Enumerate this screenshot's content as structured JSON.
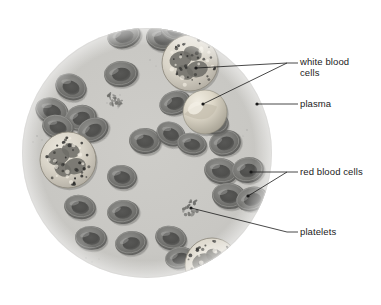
{
  "figure": {
    "type": "biological-diagram",
    "background_color": "#ffffff",
    "field_color": "#c9c8c4",
    "field_edge_color": "#b4b3af"
  },
  "microscope_field": {
    "name": "circular-field-of-view",
    "center_x": 147,
    "center_y": 153,
    "radius": 125
  },
  "labels": [
    {
      "id": "white-blood-cells",
      "text_line_1": "white blood",
      "text_line_2": "cells",
      "text_x": 300,
      "text_y": 57,
      "dash_x1": 287,
      "dash_y1": 63,
      "dash_x2": 298,
      "dash_y2": 63,
      "leaders": [
        {
          "x1": 287,
          "y1": 63,
          "x2": 196,
          "y2": 68
        },
        {
          "x1": 287,
          "y1": 63,
          "x2": 203,
          "y2": 104
        }
      ],
      "dots": [
        {
          "x": 196,
          "y": 68
        },
        {
          "x": 203,
          "y": 104
        }
      ]
    },
    {
      "id": "plasma",
      "text_line_1": "plasma",
      "text_line_2": "",
      "text_x": 300,
      "text_y": 99,
      "dash_x1": 287,
      "dash_y1": 104,
      "dash_x2": 298,
      "dash_y2": 104,
      "leaders": [
        {
          "x1": 287,
          "y1": 104,
          "x2": 257,
          "y2": 104
        }
      ],
      "dots": [
        {
          "x": 257,
          "y": 104
        }
      ]
    },
    {
      "id": "red-blood-cells",
      "text_line_1": "red blood cells",
      "text_line_2": "",
      "text_x": 300,
      "text_y": 167,
      "dash_x1": 287,
      "dash_y1": 172,
      "dash_x2": 298,
      "dash_y2": 172,
      "leaders": [
        {
          "x1": 287,
          "y1": 172,
          "x2": 251,
          "y2": 172
        },
        {
          "x1": 287,
          "y1": 172,
          "x2": 248,
          "y2": 196
        }
      ],
      "dots": [
        {
          "x": 251,
          "y": 172
        },
        {
          "x": 248,
          "y": 196
        }
      ]
    },
    {
      "id": "platelets",
      "text_line_1": "platelets",
      "text_line_2": "",
      "text_x": 300,
      "text_y": 227,
      "dash_x1": 287,
      "dash_y1": 232,
      "dash_x2": 298,
      "dash_y2": 232,
      "leaders": [
        {
          "x1": 287,
          "y1": 232,
          "x2": 191,
          "y2": 208
        }
      ],
      "dots": [
        {
          "x": 191,
          "y": 208
        }
      ]
    }
  ],
  "structures": {
    "red_blood_cells": {
      "name": "red-blood-cell",
      "count": 33,
      "rim_color": "#7a7a78",
      "center_color": "#575755",
      "highlight_color": "#9c9c99",
      "positions": [
        {
          "cx": 124,
          "cy": 36,
          "rx": 17,
          "ry": 12,
          "rot": -14
        },
        {
          "cx": 163,
          "cy": 38,
          "rx": 17,
          "ry": 13,
          "rot": 8
        },
        {
          "cx": 121,
          "cy": 74,
          "rx": 17,
          "ry": 13,
          "rot": -6
        },
        {
          "cx": 71,
          "cy": 87,
          "rx": 16,
          "ry": 13,
          "rot": 22
        },
        {
          "cx": 175,
          "cy": 103,
          "rx": 16,
          "ry": 12,
          "rot": -18
        },
        {
          "cx": 52,
          "cy": 111,
          "rx": 17,
          "ry": 13,
          "rot": 20
        },
        {
          "cx": 81,
          "cy": 118,
          "rx": 16,
          "ry": 13,
          "rot": -12
        },
        {
          "cx": 58,
          "cy": 127,
          "rx": 16,
          "ry": 12,
          "rot": 14
        },
        {
          "cx": 93,
          "cy": 130,
          "rx": 16,
          "ry": 12,
          "rot": -24
        },
        {
          "cx": 145,
          "cy": 141,
          "rx": 16,
          "ry": 13,
          "rot": 6
        },
        {
          "cx": 175,
          "cy": 30,
          "rx": 15,
          "ry": 11,
          "rot": 16
        },
        {
          "cx": 171,
          "cy": 134,
          "rx": 15,
          "ry": 12,
          "rot": 24
        },
        {
          "cx": 122,
          "cy": 177,
          "rx": 15,
          "ry": 12,
          "rot": 8
        },
        {
          "cx": 123,
          "cy": 212,
          "rx": 16,
          "ry": 12,
          "rot": -6
        },
        {
          "cx": 80,
          "cy": 207,
          "rx": 16,
          "ry": 12,
          "rot": 10
        },
        {
          "cx": 91,
          "cy": 238,
          "rx": 16,
          "ry": 12,
          "rot": 4
        },
        {
          "cx": 131,
          "cy": 243,
          "rx": 16,
          "ry": 12,
          "rot": -8
        },
        {
          "cx": 171,
          "cy": 238,
          "rx": 16,
          "ry": 12,
          "rot": 14
        },
        {
          "cx": 225,
          "cy": 143,
          "rx": 16,
          "ry": 13,
          "rot": -14
        },
        {
          "cx": 214,
          "cy": 122,
          "rx": 15,
          "ry": 12,
          "rot": 18
        },
        {
          "cx": 221,
          "cy": 171,
          "rx": 17,
          "ry": 13,
          "rot": 12
        },
        {
          "cx": 248,
          "cy": 170,
          "rx": 16,
          "ry": 13,
          "rot": -8
        },
        {
          "cx": 229,
          "cy": 196,
          "rx": 17,
          "ry": 13,
          "rot": 6
        },
        {
          "cx": 252,
          "cy": 199,
          "rx": 16,
          "ry": 12,
          "rot": -16
        },
        {
          "cx": 192,
          "cy": 144,
          "rx": 15,
          "ry": 11,
          "rot": 10
        },
        {
          "cx": 180,
          "cy": 258,
          "rx": 15,
          "ry": 11,
          "rot": -10
        },
        {
          "cx": 63,
          "cy": 158,
          "rx": 14,
          "ry": 11,
          "rot": 16
        },
        {
          "cx": 199,
          "cy": 116,
          "rx": 14,
          "ry": 11,
          "rot": -20
        }
      ]
    },
    "white_blood_cells": {
      "name": "white-blood-cell",
      "count": 4,
      "granulocyte_body_color": "#d8d4ca",
      "granule_color": "#3a3a38",
      "nucleus_color": "#6f6e6a",
      "lymphocyte_color": "#cfc9bc",
      "positions": [
        {
          "cx": 190,
          "cy": 63,
          "r": 28,
          "kind": "granulocyte"
        },
        {
          "cx": 205,
          "cy": 112,
          "r": 22,
          "kind": "monocyte-smooth"
        },
        {
          "cx": 68,
          "cy": 160,
          "r": 28,
          "kind": "granulocyte"
        },
        {
          "cx": 212,
          "cy": 265,
          "r": 27,
          "kind": "granulocyte"
        }
      ]
    },
    "platelets": {
      "name": "platelet-cluster",
      "count": 2,
      "color": "#6b6b68",
      "clusters": [
        {
          "cx": 191,
          "cy": 208,
          "spread": 9
        },
        {
          "cx": 114,
          "cy": 100,
          "spread": 8
        }
      ]
    }
  },
  "leader_line": {
    "color": "#1a1a1a",
    "width": 0.8,
    "dot_radius": 1.6
  }
}
